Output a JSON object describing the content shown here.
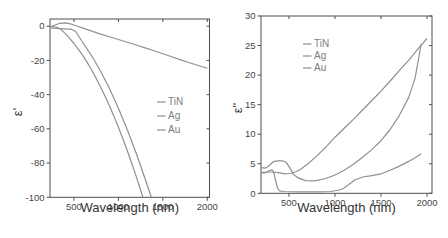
{
  "colors": {
    "background": "#ffffff",
    "curve": "#909090",
    "axis": "#4f4f4f",
    "tick_label": "#474747",
    "axis_label": "#333333",
    "legend_text": "#7d7d7d",
    "legend_dash": "#979797"
  },
  "chart_data": [
    {
      "id": "chart-left",
      "type": "line",
      "title": "",
      "xlabel": "Wavelength (nm)",
      "ylabel": "ε'",
      "xlim": [
        230,
        2025
      ],
      "ylim": [
        -100,
        4.2
      ],
      "xticks": [
        500,
        1000,
        1500,
        2000
      ],
      "yticks": [
        0,
        -20,
        -40,
        -60,
        -80,
        -100
      ],
      "grid": false,
      "legend": {
        "position": "middle-right",
        "entries": [
          "TiN",
          "Ag",
          "Au"
        ]
      },
      "series": [
        {
          "name": "TiN",
          "points": [
            [
              235,
              -0.4
            ],
            [
              280,
              0.6
            ],
            [
              340,
              1.7
            ],
            [
              400,
              2.0
            ],
            [
              450,
              1.5
            ],
            [
              500,
              0.7
            ],
            [
              550,
              -0.2
            ],
            [
              600,
              -1.1
            ],
            [
              700,
              -2.9
            ],
            [
              800,
              -4.6
            ],
            [
              900,
              -6.2
            ],
            [
              1000,
              -7.8
            ],
            [
              1100,
              -9.4
            ],
            [
              1200,
              -11.0
            ],
            [
              1300,
              -12.7
            ],
            [
              1400,
              -14.4
            ],
            [
              1500,
              -16.1
            ],
            [
              1600,
              -17.9
            ],
            [
              1700,
              -19.7
            ],
            [
              1800,
              -21.4
            ],
            [
              1900,
              -23.0
            ],
            [
              2000,
              -24.6
            ]
          ]
        },
        {
          "name": "Ag",
          "points": [
            [
              240,
              -0.2
            ],
            [
              300,
              -0.5
            ],
            [
              350,
              -1.7
            ],
            [
              400,
              -4.2
            ],
            [
              450,
              -7.0
            ],
            [
              500,
              -10.1
            ],
            [
              550,
              -13.5
            ],
            [
              600,
              -17.2
            ],
            [
              650,
              -21.3
            ],
            [
              700,
              -25.7
            ],
            [
              750,
              -30.5
            ],
            [
              800,
              -35.6
            ],
            [
              850,
              -41.0
            ],
            [
              900,
              -46.7
            ],
            [
              950,
              -52.7
            ],
            [
              1000,
              -59.1
            ],
            [
              1050,
              -65.8
            ],
            [
              1100,
              -72.8
            ],
            [
              1150,
              -80.1
            ],
            [
              1200,
              -87.8
            ],
            [
              1275,
              -100
            ]
          ]
        },
        {
          "name": "Au",
          "points": [
            [
              240,
              -1.0
            ],
            [
              300,
              -1.3
            ],
            [
              400,
              -1.6
            ],
            [
              480,
              -1.9
            ],
            [
              520,
              -3.2
            ],
            [
              600,
              -9.7
            ],
            [
              700,
              -17.4
            ],
            [
              800,
              -26.3
            ],
            [
              900,
              -36.5
            ],
            [
              1000,
              -47.9
            ],
            [
              1100,
              -60.5
            ],
            [
              1200,
              -74.3
            ],
            [
              1300,
              -89.2
            ],
            [
              1370,
              -100
            ]
          ]
        }
      ]
    },
    {
      "id": "chart-right",
      "type": "line",
      "title": "",
      "xlabel": "Wavelength (nm)",
      "ylabel": "ε\"",
      "xlim": [
        196,
        2054
      ],
      "ylim": [
        0,
        30
      ],
      "xticks": [
        500,
        1000,
        1500,
        2000
      ],
      "yticks": [
        0,
        5,
        10,
        15,
        20,
        25,
        30
      ],
      "grid": false,
      "legend": {
        "position": "upper-left",
        "entries": [
          "TiN",
          "Ag",
          "Au"
        ]
      },
      "series": [
        {
          "name": "TiN",
          "points": [
            [
              200,
              3.5
            ],
            [
              260,
              3.6
            ],
            [
              320,
              3.6
            ],
            [
              400,
              3.45
            ],
            [
              460,
              3.3
            ],
            [
              520,
              3.35
            ],
            [
              560,
              3.55
            ],
            [
              620,
              4.0
            ],
            [
              700,
              4.9
            ],
            [
              800,
              6.3
            ],
            [
              900,
              7.8
            ],
            [
              1000,
              9.5
            ],
            [
              1100,
              11.0
            ],
            [
              1200,
              12.5
            ],
            [
              1300,
              14.1
            ],
            [
              1400,
              15.7
            ],
            [
              1500,
              17.3
            ],
            [
              1600,
              19.0
            ],
            [
              1700,
              20.8
            ],
            [
              1800,
              22.5
            ],
            [
              1900,
              24.4
            ],
            [
              2000,
              26.2
            ]
          ]
        },
        {
          "name": "Ag",
          "points": [
            [
              200,
              3.4
            ],
            [
              250,
              3.5
            ],
            [
              290,
              3.85
            ],
            [
              315,
              4.0
            ],
            [
              335,
              3.5
            ],
            [
              355,
              2.2
            ],
            [
              375,
              0.9
            ],
            [
              395,
              0.4
            ],
            [
              450,
              0.3
            ],
            [
              600,
              0.25
            ],
            [
              800,
              0.25
            ],
            [
              950,
              0.3
            ],
            [
              1050,
              0.55
            ],
            [
              1100,
              0.9
            ],
            [
              1150,
              1.5
            ],
            [
              1220,
              2.3
            ],
            [
              1300,
              2.75
            ],
            [
              1400,
              3.0
            ],
            [
              1500,
              3.3
            ],
            [
              1600,
              3.9
            ],
            [
              1700,
              4.6
            ],
            [
              1800,
              5.4
            ],
            [
              1870,
              6.0
            ],
            [
              1937,
              6.7
            ]
          ]
        },
        {
          "name": "Au",
          "points": [
            [
              200,
              4.35
            ],
            [
              240,
              4.25
            ],
            [
              270,
              4.5
            ],
            [
              300,
              4.9
            ],
            [
              330,
              5.35
            ],
            [
              380,
              5.5
            ],
            [
              430,
              5.5
            ],
            [
              470,
              5.25
            ],
            [
              510,
              4.3
            ],
            [
              550,
              3.2
            ],
            [
              600,
              2.6
            ],
            [
              680,
              2.15
            ],
            [
              780,
              2.1
            ],
            [
              900,
              2.5
            ],
            [
              1000,
              3.1
            ],
            [
              1100,
              3.9
            ],
            [
              1200,
              4.9
            ],
            [
              1300,
              6.1
            ],
            [
              1400,
              7.4
            ],
            [
              1500,
              8.9
            ],
            [
              1600,
              10.8
            ],
            [
              1700,
              13.2
            ],
            [
              1800,
              16.2
            ],
            [
              1870,
              19.5
            ],
            [
              1937,
              25.3
            ]
          ]
        }
      ]
    }
  ]
}
